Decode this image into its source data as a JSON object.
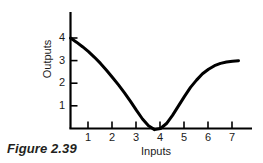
{
  "caption": "Figure 2.39",
  "chart_data": {
    "type": "line",
    "title": "",
    "subtitle": "",
    "xlabel": "Inputs",
    "ylabel": "Outputs",
    "xlim": [
      0,
      7.6
    ],
    "ylim": [
      -0.35,
      4.6
    ],
    "grid": false,
    "legend": null,
    "x_ticks": [
      1,
      2,
      3,
      4,
      5,
      6,
      7
    ],
    "x_tick_labels": [
      "1",
      "2",
      "3",
      "4",
      "5",
      "6",
      "7"
    ],
    "y_ticks": [
      1,
      2,
      3,
      4
    ],
    "y_tick_labels": [
      "1",
      "2",
      "3",
      "4"
    ],
    "line_color": "#000000",
    "line_width": 3,
    "annotations": [],
    "series": [
      {
        "name": "cost curve",
        "x": [
          0.0,
          0.25,
          0.5,
          0.75,
          1.0,
          1.25,
          1.5,
          1.75,
          2.0,
          2.25,
          2.5,
          2.75,
          3.0,
          3.25,
          3.5,
          3.75,
          4.0,
          4.25,
          4.5,
          4.75,
          5.0,
          5.25,
          5.5,
          5.75,
          6.0,
          6.25,
          6.5,
          6.75,
          7.0
        ],
        "y": [
          4.0,
          3.82,
          3.62,
          3.4,
          3.15,
          2.88,
          2.58,
          2.26,
          1.93,
          1.58,
          1.2,
          0.8,
          0.42,
          0.12,
          -0.05,
          0.0,
          0.22,
          0.58,
          1.0,
          1.42,
          1.82,
          2.14,
          2.42,
          2.62,
          2.78,
          2.88,
          2.94,
          2.98,
          3.0
        ]
      }
    ]
  }
}
